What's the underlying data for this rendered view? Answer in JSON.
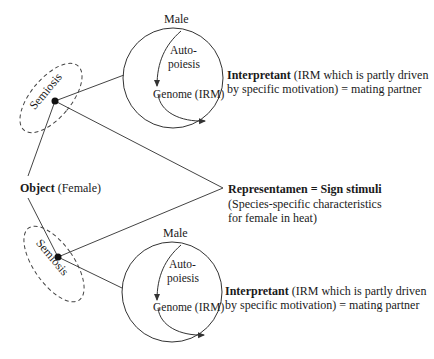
{
  "diagram": {
    "type": "semiotic-triad",
    "colors": {
      "stroke": "#333333",
      "text": "#1a1a1a",
      "background": "#ffffff"
    },
    "object": {
      "bold": "Object",
      "rest": "(Female)"
    },
    "representamen": {
      "bold": "Representamen = Sign stimuli",
      "line2": "(Species-specific characteristics",
      "line3": "for female in heat)"
    },
    "semiosis_top": {
      "label": "Semiosis"
    },
    "semiosis_bottom": {
      "label": "Semiosis"
    },
    "male_top": {
      "title": "Male",
      "auto1": "Auto-",
      "auto2": "poiesis",
      "genome": "Genome (IRM)"
    },
    "male_bottom": {
      "title": "Male",
      "auto1": "Auto-",
      "auto2": "poiesis",
      "genome": "Genome (IRM)"
    },
    "interpretant_top": {
      "bold": "Interpretant",
      "rest1": " (IRM which is partly driven",
      "line2": "by specific motivation) = mating partner"
    },
    "interpretant_bottom": {
      "bold": "Interpretant",
      "rest1": " (IRM which is partly driven",
      "line2": "by specific motivation) = mating partner"
    }
  }
}
